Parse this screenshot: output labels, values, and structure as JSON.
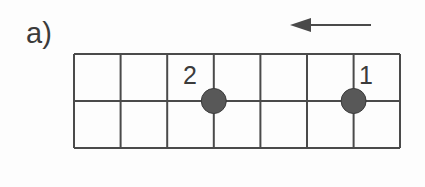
{
  "figure": {
    "panel_label": "a)",
    "background_color": "#fdfdfd",
    "line_color": "#4a4a4a",
    "particle_fill_color": "#585858",
    "particle_stroke_color": "#3a3a3a",
    "text_color": "#3b3b3b"
  },
  "lattice": {
    "columns": 7,
    "rows": 2,
    "x_left": 74,
    "x_right": 400,
    "y_top": 54,
    "y_middle": 101,
    "y_bottom": 148,
    "cell_width": 46.6,
    "vertical_line_x": [
      74,
      120.6,
      167.2,
      213.8,
      260.4,
      307,
      353.6,
      400
    ],
    "horizontal_line_y": [
      54,
      101,
      148
    ],
    "line_width": 2
  },
  "particles": [
    {
      "label": "2",
      "cx": 213.8,
      "cy": 101,
      "radius": 12.5,
      "label_x": 190,
      "label_y": 84
    },
    {
      "label": "1",
      "cx": 353.6,
      "cy": 101,
      "radius": 12.5,
      "label_x": 366,
      "label_y": 84
    }
  ],
  "arrow": {
    "direction": "left",
    "tip_x": 290,
    "tail_x": 371,
    "y": 25,
    "head_length": 21,
    "head_half_height": 7,
    "shaft_width": 2
  }
}
